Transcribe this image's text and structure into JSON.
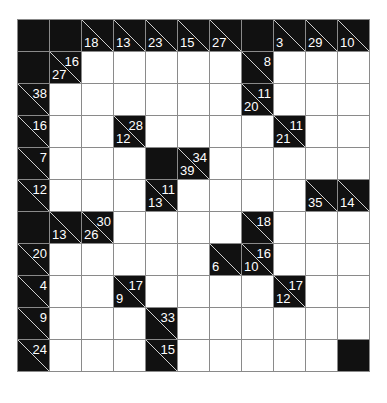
{
  "puzzle": {
    "type": "kakuro",
    "rows": 11,
    "cols": 11,
    "colors": {
      "block": "#111111",
      "cell": "#ffffff",
      "grid": "#8a8a8a",
      "clue_text": "#ffffff"
    },
    "grid": [
      [
        {
          "t": "B"
        },
        {
          "t": "B"
        },
        {
          "t": "C",
          "d": "18"
        },
        {
          "t": "C",
          "d": "13"
        },
        {
          "t": "C",
          "d": "23"
        },
        {
          "t": "C",
          "d": "15"
        },
        {
          "t": "C",
          "d": "27"
        },
        {
          "t": "B"
        },
        {
          "t": "C",
          "d": "3"
        },
        {
          "t": "C",
          "d": "29"
        },
        {
          "t": "C",
          "d": "10"
        }
      ],
      [
        {
          "t": "B"
        },
        {
          "t": "C",
          "a": "16",
          "d": "27"
        },
        {
          "t": "W"
        },
        {
          "t": "W"
        },
        {
          "t": "W"
        },
        {
          "t": "W"
        },
        {
          "t": "W"
        },
        {
          "t": "C",
          "a": "8"
        },
        {
          "t": "W"
        },
        {
          "t": "W"
        },
        {
          "t": "W"
        }
      ],
      [
        {
          "t": "C",
          "a": "38"
        },
        {
          "t": "W"
        },
        {
          "t": "W"
        },
        {
          "t": "W"
        },
        {
          "t": "W"
        },
        {
          "t": "W"
        },
        {
          "t": "W"
        },
        {
          "t": "C",
          "a": "11",
          "d": "20"
        },
        {
          "t": "W"
        },
        {
          "t": "W"
        },
        {
          "t": "W"
        }
      ],
      [
        {
          "t": "C",
          "a": "16"
        },
        {
          "t": "W"
        },
        {
          "t": "W"
        },
        {
          "t": "C",
          "a": "28",
          "d": "12"
        },
        {
          "t": "W"
        },
        {
          "t": "W"
        },
        {
          "t": "W"
        },
        {
          "t": "W"
        },
        {
          "t": "C",
          "a": "11",
          "d": "21"
        },
        {
          "t": "W"
        },
        {
          "t": "W"
        }
      ],
      [
        {
          "t": "C",
          "a": "7"
        },
        {
          "t": "W"
        },
        {
          "t": "W"
        },
        {
          "t": "W"
        },
        {
          "t": "B"
        },
        {
          "t": "C",
          "a": "34",
          "d": "39"
        },
        {
          "t": "W"
        },
        {
          "t": "W"
        },
        {
          "t": "W"
        },
        {
          "t": "W"
        },
        {
          "t": "W"
        }
      ],
      [
        {
          "t": "C",
          "a": "12"
        },
        {
          "t": "W"
        },
        {
          "t": "W"
        },
        {
          "t": "W"
        },
        {
          "t": "C",
          "a": "11",
          "d": "13"
        },
        {
          "t": "W"
        },
        {
          "t": "W"
        },
        {
          "t": "W"
        },
        {
          "t": "W"
        },
        {
          "t": "C",
          "d": "35"
        },
        {
          "t": "C",
          "d": "14"
        }
      ],
      [
        {
          "t": "B"
        },
        {
          "t": "C",
          "d": "13"
        },
        {
          "t": "C",
          "a": "30",
          "d": "26"
        },
        {
          "t": "W"
        },
        {
          "t": "W"
        },
        {
          "t": "W"
        },
        {
          "t": "W"
        },
        {
          "t": "C",
          "a": "18"
        },
        {
          "t": "W"
        },
        {
          "t": "W"
        },
        {
          "t": "W"
        }
      ],
      [
        {
          "t": "C",
          "a": "20"
        },
        {
          "t": "W"
        },
        {
          "t": "W"
        },
        {
          "t": "W"
        },
        {
          "t": "W"
        },
        {
          "t": "W"
        },
        {
          "t": "C",
          "d": "6"
        },
        {
          "t": "C",
          "a": "16",
          "d": "10"
        },
        {
          "t": "W"
        },
        {
          "t": "W"
        },
        {
          "t": "W"
        }
      ],
      [
        {
          "t": "C",
          "a": "4"
        },
        {
          "t": "W"
        },
        {
          "t": "W"
        },
        {
          "t": "C",
          "a": "17",
          "d": "9"
        },
        {
          "t": "W"
        },
        {
          "t": "W"
        },
        {
          "t": "W"
        },
        {
          "t": "W"
        },
        {
          "t": "C",
          "a": "17",
          "d": "12"
        },
        {
          "t": "W"
        },
        {
          "t": "W"
        }
      ],
      [
        {
          "t": "C",
          "a": "9"
        },
        {
          "t": "W"
        },
        {
          "t": "W"
        },
        {
          "t": "W"
        },
        {
          "t": "C",
          "a": "33"
        },
        {
          "t": "W"
        },
        {
          "t": "W"
        },
        {
          "t": "W"
        },
        {
          "t": "W"
        },
        {
          "t": "W"
        },
        {
          "t": "W"
        }
      ],
      [
        {
          "t": "C",
          "a": "24"
        },
        {
          "t": "W"
        },
        {
          "t": "W"
        },
        {
          "t": "W"
        },
        {
          "t": "C",
          "a": "15"
        },
        {
          "t": "W"
        },
        {
          "t": "W"
        },
        {
          "t": "W"
        },
        {
          "t": "W"
        },
        {
          "t": "W"
        },
        {
          "t": "B"
        }
      ]
    ]
  }
}
